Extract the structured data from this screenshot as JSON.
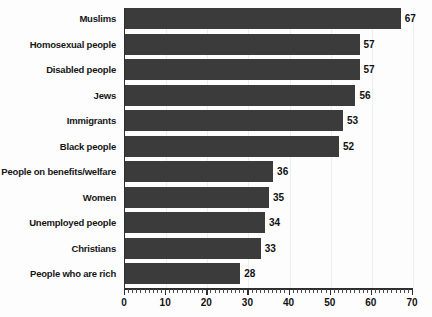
{
  "chart_data": {
    "type": "bar",
    "orientation": "horizontal",
    "title": "",
    "subtitle": "",
    "xlabel": "",
    "ylabel": "",
    "xlim": [
      0,
      70
    ],
    "xticks": [
      0,
      10,
      20,
      30,
      40,
      50,
      60,
      70
    ],
    "minor_tick_step": 1,
    "grid": true,
    "grid_axis": "x",
    "legend": false,
    "show_value_labels": true,
    "categories": [
      "Muslims",
      "Homosexual people",
      "Disabled people",
      "Jews",
      "Immigrants",
      "Black people",
      "People on benefits/welfare",
      "Women",
      "Unemployed people",
      "Christians",
      "People who are rich"
    ],
    "values": [
      67,
      57,
      57,
      56,
      53,
      52,
      36,
      35,
      34,
      33,
      28
    ]
  },
  "style": {
    "bar_color": "#3b3b3b",
    "axis_color": "#2e2e2e",
    "grid_color": "#eceff1",
    "label_color": "#161616",
    "background": "#fdfdfd"
  }
}
